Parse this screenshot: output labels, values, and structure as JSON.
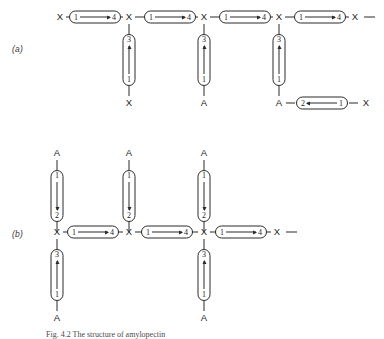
{
  "figure": {
    "caption": "Fig. 4.2  The structure of amylopectin",
    "panels": [
      {
        "id": "a",
        "label": "(a)",
        "backbone": {
          "nodes": [
            "X",
            "X",
            "X",
            "X",
            "X"
          ],
          "links": [
            {
              "from": "1",
              "to": "4",
              "direction": "right"
            },
            {
              "from": "1",
              "to": "4",
              "direction": "right"
            },
            {
              "from": "1",
              "to": "4",
              "direction": "right"
            },
            {
              "from": "1",
              "to": "4",
              "direction": "right"
            }
          ],
          "trailing_symbol": "—"
        },
        "branches": [
          {
            "orientation": "down",
            "attached_to_node": 2,
            "link": {
              "from": "3",
              "to": "1",
              "direction": "up"
            },
            "terminal": "X"
          },
          {
            "orientation": "down",
            "attached_to_node": 3,
            "link": {
              "from": "3",
              "to": "1",
              "direction": "up"
            },
            "terminal": "A"
          },
          {
            "orientation": "down",
            "attached_to_node": 4,
            "link": {
              "from": "3",
              "to": "1",
              "direction": "up"
            },
            "terminal": "A",
            "side_chain": {
              "link": {
                "from": "2",
                "to": "1",
                "direction": "left"
              },
              "terminal": "X"
            }
          }
        ]
      },
      {
        "id": "b",
        "label": "(b)",
        "backbone": {
          "nodes": [
            "X",
            "X",
            "X",
            "X"
          ],
          "links": [
            {
              "from": "1",
              "to": "4",
              "direction": "right"
            },
            {
              "from": "1",
              "to": "4",
              "direction": "right"
            },
            {
              "from": "1",
              "to": "4",
              "direction": "right"
            }
          ],
          "trailing_symbol": "—"
        },
        "branches": [
          {
            "orientation": "up",
            "attached_to_node": 1,
            "link": {
              "from": "1",
              "to": "2",
              "direction": "down"
            },
            "terminal": "A"
          },
          {
            "orientation": "up",
            "attached_to_node": 2,
            "link": {
              "from": "1",
              "to": "2",
              "direction": "down"
            },
            "terminal": "A"
          },
          {
            "orientation": "up",
            "attached_to_node": 3,
            "link": {
              "from": "1",
              "to": "2",
              "direction": "down"
            },
            "terminal": "A"
          },
          {
            "orientation": "down",
            "attached_to_node": 1,
            "link": {
              "from": "3",
              "to": "1",
              "direction": "up"
            },
            "terminal": "A"
          },
          {
            "orientation": "down",
            "attached_to_node": 3,
            "link": {
              "from": "3",
              "to": "1",
              "direction": "up"
            },
            "terminal": "A"
          }
        ]
      }
    ]
  }
}
